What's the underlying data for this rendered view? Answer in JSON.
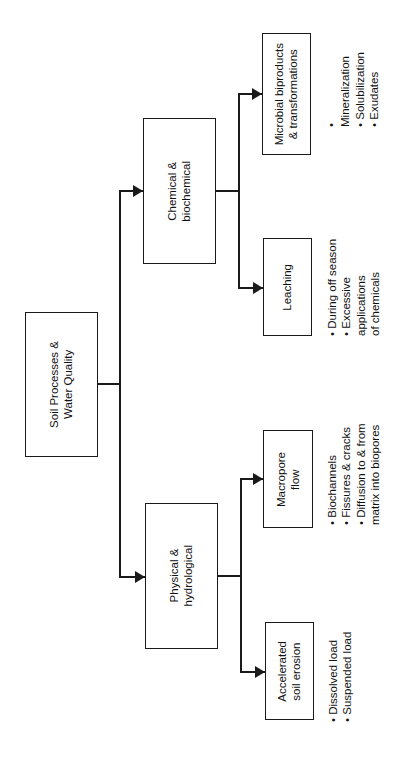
{
  "diagram": {
    "title": "Soil Processes & Water Quality",
    "root": {
      "label": "Soil Processes &\nWater Quality"
    },
    "branches": [
      {
        "label": "Chemical &\nbiochemical",
        "children": [
          {
            "label": "Microbial biproducts\n& transformations",
            "bullets": [
              "Mineralization",
              "Solubilization",
              "Exudates"
            ]
          },
          {
            "label": "Leaching",
            "bullets": [
              "During off season",
              "Excessive applications\nof chemicals"
            ]
          }
        ]
      },
      {
        "label": "Physical &\nhydrological",
        "children": [
          {
            "label": "Macropore\nflow",
            "bullets": [
              "Biochannels",
              "Fissures & cracks",
              "Diffusion to & from\nmatrix into biopores"
            ]
          },
          {
            "label": "Accelerated\nsoil erosion",
            "bullets": [
              "Dissolved load",
              "Suspended load"
            ]
          }
        ]
      }
    ],
    "colors": {
      "line": "#1a1a1a",
      "background": "#ffffff"
    },
    "bullet_glyph": "•"
  }
}
